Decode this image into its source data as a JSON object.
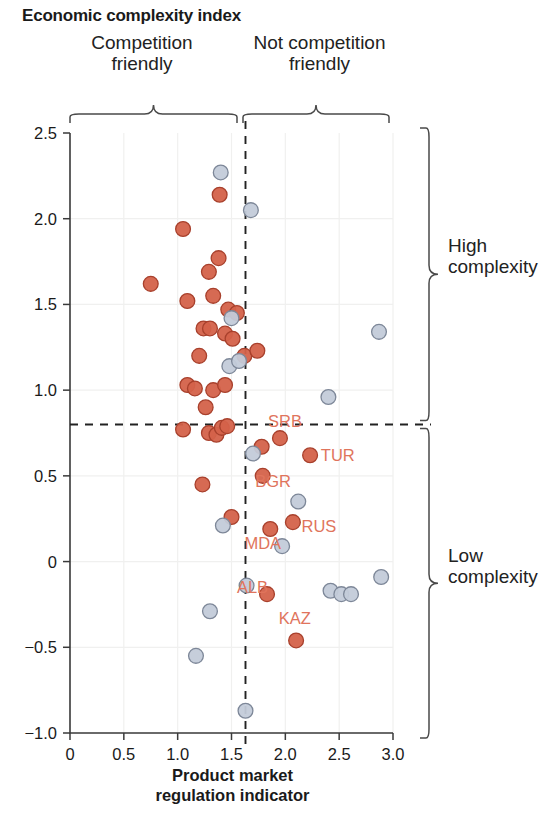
{
  "title": "Economic complexity index",
  "annotations": {
    "top_left": "Competition\nfriendly",
    "top_right": "Not competition\nfriendly",
    "side_top": "High\ncomplexity",
    "side_bottom": "Low\ncomplexity"
  },
  "axis_title": "Product market\nregulation indicator",
  "colors": {
    "orange": "#d4624a",
    "orange_edge": "#a8402c",
    "blue": "#c3cbd9",
    "blue_edge": "#7d8798",
    "label": "#e0745c",
    "axis": "#3a3a3a",
    "grid": "#f0f0ef",
    "dash": "#222222"
  },
  "chart_data": {
    "type": "scatter",
    "title": "Economic complexity index",
    "xlabel": "Product market regulation indicator",
    "ylabel": "Economic complexity index",
    "xlim": [
      0,
      3.0
    ],
    "ylim": [
      -1.0,
      2.5
    ],
    "xticks": [
      "0",
      "0.5",
      "1.0",
      "1.5",
      "2.0",
      "2.5",
      "3.0"
    ],
    "xtick_values": [
      0,
      0.5,
      1.0,
      1.5,
      2.0,
      2.5,
      3.0
    ],
    "yticks": [
      "2.5",
      "2.0",
      "1.5",
      "1.0",
      "0.5",
      "0",
      "-0.5",
      "-1.0"
    ],
    "ytick_values": [
      2.5,
      2.0,
      1.5,
      1.0,
      0.5,
      0,
      -0.5,
      -1.0
    ],
    "grid": true,
    "legend": "none",
    "reference_lines": [
      {
        "orientation": "vertical",
        "value": 1.63,
        "style": "dashed"
      },
      {
        "orientation": "horizontal",
        "value": 0.8,
        "style": "dashed"
      }
    ],
    "quadrant_labels": {
      "left": "Competition friendly",
      "right": "Not competition friendly",
      "top": "High complexity",
      "bottom": "Low complexity"
    },
    "series": [
      {
        "name": "highlighted",
        "color": "#d4624a",
        "points": [
          {
            "x": 1.39,
            "y": 2.14
          },
          {
            "x": 1.05,
            "y": 1.94
          },
          {
            "x": 1.38,
            "y": 1.77
          },
          {
            "x": 0.75,
            "y": 1.62
          },
          {
            "x": 1.29,
            "y": 1.69
          },
          {
            "x": 1.09,
            "y": 1.52
          },
          {
            "x": 1.33,
            "y": 1.55
          },
          {
            "x": 1.47,
            "y": 1.47
          },
          {
            "x": 1.55,
            "y": 1.45
          },
          {
            "x": 1.24,
            "y": 1.36
          },
          {
            "x": 1.3,
            "y": 1.36
          },
          {
            "x": 1.44,
            "y": 1.33
          },
          {
            "x": 1.51,
            "y": 1.3
          },
          {
            "x": 1.2,
            "y": 1.2
          },
          {
            "x": 1.62,
            "y": 1.2
          },
          {
            "x": 1.74,
            "y": 1.23
          },
          {
            "x": 1.09,
            "y": 1.03
          },
          {
            "x": 1.16,
            "y": 1.01
          },
          {
            "x": 1.33,
            "y": 1.0
          },
          {
            "x": 1.44,
            "y": 1.03
          },
          {
            "x": 1.26,
            "y": 0.9
          },
          {
            "x": 1.05,
            "y": 0.77
          },
          {
            "x": 1.29,
            "y": 0.75
          },
          {
            "x": 1.36,
            "y": 0.74
          },
          {
            "x": 1.41,
            "y": 0.78
          },
          {
            "x": 1.46,
            "y": 0.79
          },
          {
            "x": 1.23,
            "y": 0.45
          },
          {
            "x": 1.5,
            "y": 0.26
          },
          {
            "x": 1.78,
            "y": 0.67
          },
          {
            "x": 1.95,
            "y": 0.72
          },
          {
            "x": 2.23,
            "y": 0.62
          },
          {
            "x": 1.79,
            "y": 0.5
          },
          {
            "x": 1.86,
            "y": 0.19
          },
          {
            "x": 2.07,
            "y": 0.23
          },
          {
            "x": 1.83,
            "y": -0.19
          },
          {
            "x": 2.1,
            "y": -0.46
          }
        ]
      },
      {
        "name": "other",
        "color": "#c3cbd9",
        "points": [
          {
            "x": 1.4,
            "y": 2.27
          },
          {
            "x": 1.68,
            "y": 2.05
          },
          {
            "x": 1.5,
            "y": 1.42
          },
          {
            "x": 1.48,
            "y": 1.14
          },
          {
            "x": 1.57,
            "y": 1.17
          },
          {
            "x": 2.87,
            "y": 1.34
          },
          {
            "x": 2.4,
            "y": 0.96
          },
          {
            "x": 1.7,
            "y": 0.63
          },
          {
            "x": 2.12,
            "y": 0.35
          },
          {
            "x": 1.42,
            "y": 0.21
          },
          {
            "x": 1.97,
            "y": 0.09
          },
          {
            "x": 1.64,
            "y": -0.14
          },
          {
            "x": 2.42,
            "y": -0.17
          },
          {
            "x": 2.52,
            "y": -0.19
          },
          {
            "x": 2.61,
            "y": -0.19
          },
          {
            "x": 2.89,
            "y": -0.09
          },
          {
            "x": 1.3,
            "y": -0.29
          },
          {
            "x": 1.17,
            "y": -0.55
          },
          {
            "x": 1.63,
            "y": -0.87
          }
        ]
      }
    ],
    "point_labels": [
      {
        "text": "SRB",
        "x": 1.84,
        "y": 0.82
      },
      {
        "text": "TUR",
        "x": 2.33,
        "y": 0.62
      },
      {
        "text": "BGR",
        "x": 1.72,
        "y": 0.47
      },
      {
        "text": "RUS",
        "x": 2.15,
        "y": 0.21
      },
      {
        "text": "MDA",
        "x": 1.62,
        "y": 0.11
      },
      {
        "text": "ALB",
        "x": 1.55,
        "y": -0.15
      },
      {
        "text": "KAZ",
        "x": 1.94,
        "y": -0.33
      }
    ]
  }
}
